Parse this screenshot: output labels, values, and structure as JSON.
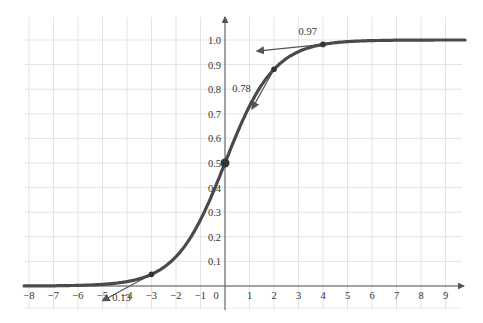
{
  "chart_data": {
    "type": "line",
    "title": "",
    "xlabel": "",
    "ylabel": "",
    "function": "logistic sigmoid S-curve, f(0)=0.5, approaching 0 and 1",
    "xlim": [
      -8.2,
      9.8
    ],
    "ylim": [
      -0.05,
      1.08
    ],
    "x_ticks": [
      -8,
      -7,
      -6,
      -5,
      -4,
      -3,
      -2,
      -1,
      0,
      1,
      2,
      3,
      4,
      5,
      6,
      7,
      8,
      9
    ],
    "y_ticks": [
      0.1,
      0.2,
      0.3,
      0.4,
      0.5,
      0.6,
      0.7,
      0.8,
      0.9,
      1.0
    ],
    "x_tick_labels": [
      "−8",
      "−7",
      "−6",
      "−5",
      "−4",
      "−3",
      "−2",
      "−1",
      "0",
      "1",
      "2",
      "3",
      "4",
      "5",
      "6",
      "7",
      "8",
      "9"
    ],
    "y_tick_labels": [
      "0.1",
      "0.2",
      "0.3",
      "0.4",
      "0.5",
      "0.6",
      "0.7",
      "0.8",
      "0.9",
      "1.0"
    ],
    "grid": true,
    "series": [
      {
        "name": "curve",
        "x": [
          -8,
          -6,
          -4,
          -3,
          -2,
          -1,
          0,
          1,
          2,
          3,
          4,
          6,
          9.8
        ],
        "y": [
          0.0,
          0.005,
          0.02,
          0.047,
          0.12,
          0.27,
          0.5,
          0.73,
          0.88,
          0.953,
          0.98,
          0.995,
          1.0
        ]
      }
    ],
    "points": [
      {
        "x": -3,
        "y": 0.047
      },
      {
        "x": 0,
        "y": 0.5
      },
      {
        "x": 2,
        "y": 0.88
      },
      {
        "x": 4,
        "y": 0.98
      }
    ],
    "annotations": [
      {
        "text": "0.13",
        "x": -4.6,
        "y": -0.06,
        "note": "tangent slope label at x=-3"
      },
      {
        "text": "0.78",
        "x": 0.3,
        "y": 0.79,
        "note": "tangent slope label at x=2"
      },
      {
        "text": "0.97",
        "x": 3.0,
        "y": 1.02,
        "note": "tangent slope label at x=4"
      }
    ]
  }
}
